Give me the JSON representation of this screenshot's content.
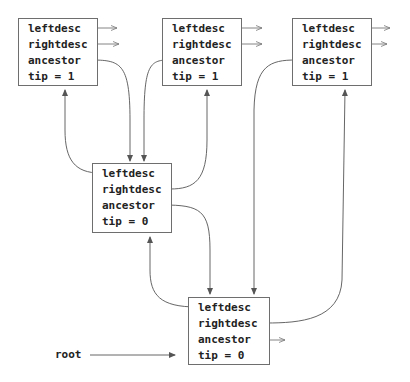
{
  "diagram": {
    "type": "tree-node-pointer-diagram",
    "root_label": "root",
    "nodes": [
      {
        "id": "A",
        "fields": [
          "leftdesc",
          "rightdesc",
          "ancestor",
          "tip = 1"
        ],
        "tip": 1
      },
      {
        "id": "B",
        "fields": [
          "leftdesc",
          "rightdesc",
          "ancestor",
          "tip = 1"
        ],
        "tip": 1
      },
      {
        "id": "C",
        "fields": [
          "leftdesc",
          "rightdesc",
          "ancestor",
          "tip = 1"
        ],
        "tip": 1
      },
      {
        "id": "D",
        "fields": [
          "leftdesc",
          "rightdesc",
          "ancestor",
          "tip = 0"
        ],
        "tip": 0
      },
      {
        "id": "E",
        "fields": [
          "leftdesc",
          "rightdesc",
          "ancestor",
          "tip = 0"
        ],
        "tip": 0
      }
    ],
    "edges": [
      {
        "from": "A.ancestor",
        "to": "D"
      },
      {
        "from": "B.ancestor",
        "to": "D"
      },
      {
        "from": "C.ancestor",
        "to": "E"
      },
      {
        "from": "D.leftdesc",
        "to": "A"
      },
      {
        "from": "D.rightdesc",
        "to": "B"
      },
      {
        "from": "D.ancestor",
        "to": "E"
      },
      {
        "from": "E.leftdesc",
        "to": "D"
      },
      {
        "from": "E.rightdesc",
        "to": "C"
      },
      {
        "from": "root",
        "to": "E"
      },
      {
        "from": "A.leftdesc",
        "to": "null"
      },
      {
        "from": "A.rightdesc",
        "to": "null"
      },
      {
        "from": "B.leftdesc",
        "to": "null"
      },
      {
        "from": "B.rightdesc",
        "to": "null"
      },
      {
        "from": "C.leftdesc",
        "to": "null"
      },
      {
        "from": "C.rightdesc",
        "to": "null"
      },
      {
        "from": "E.ancestor",
        "to": "null"
      }
    ],
    "line_color": "#555555",
    "border_color": "#6e6e6e"
  }
}
